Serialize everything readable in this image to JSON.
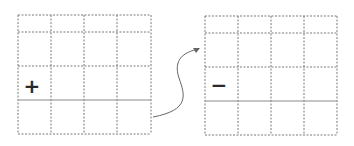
{
  "diagram": {
    "left_grid": {
      "columns": 4,
      "rows": 4,
      "symbol": "+",
      "symbol_cell": {
        "row": 3,
        "col": 1
      },
      "solid_line_after_row": 3
    },
    "right_grid": {
      "columns": 4,
      "rows": 4,
      "symbol": "−",
      "symbol_cell": {
        "row": 3,
        "col": 1
      },
      "solid_line_after_row": 3
    },
    "arrow": {
      "from": "left_grid",
      "to": "right_grid",
      "style": "curved"
    },
    "colors": {
      "grid_line": "#7a7a7a",
      "solid_line": "#8c8c8c",
      "symbol": "#2a2a2a",
      "arrow": "#666666"
    }
  }
}
